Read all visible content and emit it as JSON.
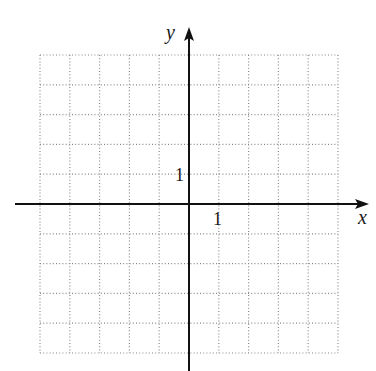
{
  "diagram": {
    "type": "coordinate-plane",
    "axes": {
      "x_label": "x",
      "y_label": "y",
      "x_tick_label": "1",
      "y_tick_label": "1"
    },
    "grid": {
      "x_range": [
        -5,
        5
      ],
      "y_range": [
        -5,
        5
      ],
      "unit": 1,
      "line_style": "dotted"
    },
    "colors": {
      "axis": "#111111",
      "grid": "#8a8a8a",
      "background": "#ffffff"
    }
  }
}
